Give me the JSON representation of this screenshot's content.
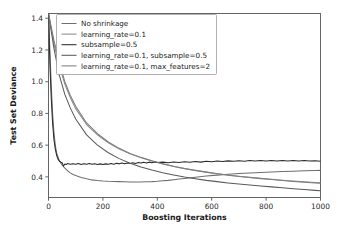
{
  "chart_data": {
    "type": "line",
    "title": "",
    "xlabel": "Boosting Iterations",
    "ylabel": "Test Set Deviance",
    "xlim": [
      0,
      1000
    ],
    "ylim": [
      0.27,
      1.43
    ],
    "xticks": [
      0,
      200,
      400,
      600,
      800,
      1000
    ],
    "xtick_labels": [
      "0",
      "200",
      "400",
      "600",
      "800",
      "1000"
    ],
    "yticks": [
      0.4,
      0.6,
      0.8,
      1.0,
      1.2,
      1.4
    ],
    "ytick_labels": [
      "0.4",
      "0.6",
      "0.8",
      "1.0",
      "1.2",
      "1.4"
    ],
    "grid": false,
    "legend_position": "upper-left",
    "series": [
      {
        "name": "No shrinkage",
        "color": "#6f6f6f",
        "x": [
          0,
          5,
          10,
          15,
          20,
          25,
          30,
          40,
          50,
          60,
          70,
          80,
          90,
          100,
          120,
          140,
          160,
          180,
          200,
          220,
          240,
          260,
          280,
          300,
          320,
          340,
          360,
          380,
          400,
          420,
          440,
          460,
          480,
          500,
          540,
          580,
          620,
          660,
          700,
          740,
          780,
          820,
          860,
          900,
          940,
          980,
          1000
        ],
        "y": [
          1.43,
          1.2,
          0.98,
          0.8,
          0.68,
          0.6,
          0.55,
          0.5,
          0.475,
          0.455,
          0.44,
          0.425,
          0.415,
          0.408,
          0.396,
          0.388,
          0.381,
          0.377,
          0.374,
          0.372,
          0.371,
          0.37,
          0.369,
          0.368,
          0.368,
          0.368,
          0.369,
          0.37,
          0.372,
          0.375,
          0.378,
          0.382,
          0.386,
          0.39,
          0.398,
          0.405,
          0.411,
          0.416,
          0.421,
          0.425,
          0.428,
          0.431,
          0.434,
          0.436,
          0.438,
          0.44,
          0.441
        ]
      },
      {
        "name": "learning_rate=0.1",
        "color": "#8a8a8a",
        "x": [
          0,
          20,
          40,
          60,
          80,
          100,
          140,
          180,
          220,
          260,
          300,
          340,
          380,
          420,
          460,
          500,
          540,
          580,
          620,
          660,
          700,
          740,
          780,
          820,
          860,
          900,
          940,
          980,
          1000
        ],
        "y": [
          1.43,
          1.24,
          1.1,
          0.985,
          0.9,
          0.83,
          0.73,
          0.665,
          0.615,
          0.575,
          0.545,
          0.52,
          0.5,
          0.482,
          0.466,
          0.452,
          0.44,
          0.43,
          0.42,
          0.412,
          0.404,
          0.397,
          0.391,
          0.385,
          0.379,
          0.374,
          0.369,
          0.365,
          0.363
        ]
      },
      {
        "name": "subsample=0.5",
        "color": "#2b2b2b",
        "x": [
          0,
          5,
          10,
          15,
          20,
          25,
          30,
          35,
          40,
          45,
          50,
          55,
          60,
          65,
          70,
          80,
          90,
          100,
          110,
          120,
          130,
          140,
          150,
          160,
          170,
          180,
          190,
          200,
          210,
          220,
          230,
          240,
          250,
          260,
          270,
          280,
          290,
          300,
          310,
          320,
          330,
          340,
          350,
          360,
          370,
          380,
          390,
          400,
          420,
          440,
          460,
          480,
          500,
          520,
          540,
          560,
          580,
          600,
          620,
          640,
          660,
          680,
          700,
          720,
          740,
          760,
          780,
          800,
          820,
          840,
          860,
          880,
          900,
          920,
          940,
          960,
          980,
          1000
        ],
        "y": [
          1.43,
          1.12,
          0.9,
          0.74,
          0.635,
          0.575,
          0.535,
          0.512,
          0.5,
          0.493,
          0.49,
          0.468,
          0.481,
          0.478,
          0.484,
          0.479,
          0.483,
          0.479,
          0.484,
          0.478,
          0.483,
          0.479,
          0.484,
          0.48,
          0.483,
          0.478,
          0.482,
          0.478,
          0.482,
          0.479,
          0.484,
          0.48,
          0.486,
          0.482,
          0.487,
          0.483,
          0.488,
          0.484,
          0.489,
          0.485,
          0.49,
          0.487,
          0.492,
          0.488,
          0.493,
          0.489,
          0.494,
          0.49,
          0.493,
          0.489,
          0.494,
          0.491,
          0.496,
          0.492,
          0.497,
          0.493,
          0.498,
          0.495,
          0.5,
          0.497,
          0.501,
          0.498,
          0.502,
          0.499,
          0.503,
          0.5,
          0.503,
          0.5,
          0.503,
          0.5,
          0.503,
          0.5,
          0.503,
          0.5,
          0.503,
          0.5,
          0.502,
          0.499
        ]
      },
      {
        "name": "learning_rate=0.1, subsample=0.5",
        "color": "#5a5a5a",
        "x": [
          0,
          20,
          40,
          60,
          80,
          100,
          140,
          180,
          220,
          260,
          300,
          340,
          380,
          420,
          460,
          500,
          540,
          580,
          620,
          660,
          700,
          740,
          780,
          820,
          860,
          900,
          940,
          980,
          1000
        ],
        "y": [
          1.43,
          1.21,
          1.04,
          0.92,
          0.835,
          0.765,
          0.665,
          0.6,
          0.552,
          0.515,
          0.486,
          0.462,
          0.443,
          0.426,
          0.412,
          0.399,
          0.388,
          0.378,
          0.37,
          0.362,
          0.355,
          0.349,
          0.343,
          0.337,
          0.331,
          0.325,
          0.32,
          0.315,
          0.312
        ]
      },
      {
        "name": "learning_rate=0.1, max_features=2",
        "color": "#7d7d7d",
        "x": [
          0,
          20,
          40,
          60,
          80,
          100,
          140,
          180,
          220,
          260,
          300,
          340,
          380,
          420,
          460,
          500,
          540,
          580,
          620,
          660,
          700,
          740,
          780,
          820,
          860,
          900,
          940,
          980,
          1000
        ],
        "y": [
          1.43,
          1.26,
          1.12,
          1.0,
          0.915,
          0.845,
          0.74,
          0.672,
          0.62,
          0.58,
          0.548,
          0.523,
          0.502,
          0.483,
          0.467,
          0.453,
          0.441,
          0.43,
          0.42,
          0.411,
          0.403,
          0.396,
          0.389,
          0.383,
          0.377,
          0.371,
          0.366,
          0.362,
          0.36
        ]
      }
    ]
  }
}
